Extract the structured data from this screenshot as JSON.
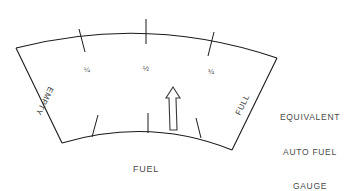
{
  "diagram": {
    "title": "Equivalent Auto Fuel Gauge",
    "background_color": "#ffffff",
    "line_color": "#1a1a1a",
    "text_color": "#4a4a4a"
  },
  "gauge": {
    "type": "arc-sector-fuel-gauge",
    "scale_labels": [
      {
        "id": "quarter",
        "text": "¼",
        "x": 87,
        "y": 70
      },
      {
        "id": "half",
        "text": "½",
        "x": 146,
        "y": 69
      },
      {
        "id": "three-quarter",
        "text": "¾",
        "x": 211,
        "y": 72
      }
    ],
    "edge_labels": [
      {
        "id": "empty",
        "text": "EMPTY",
        "x": 44,
        "y": 101,
        "rotation": -244
      },
      {
        "id": "full",
        "text": "FULL",
        "x": 243,
        "y": 105,
        "rotation": -64
      }
    ],
    "needle": {
      "label": "fuel-level-needle",
      "points": "173,87 180,98 176,98 177,130 170,130 169,98 166,98",
      "indicated_level": "just above ½"
    },
    "outer_arc": "M 16,48 Q 148,14 277,58",
    "inner_arc": "M 62,143 Q 150,117 232,150",
    "left_edge": "M 16,48 L 62,143",
    "right_edge": "M 277,58 L 232,150",
    "outer_ticks": [
      "M 79,29 L 85,52",
      "M 146,19 L 146,44",
      "M 214,32 L 208,56"
    ],
    "inner_ticks": [
      "M 98,115 L 92,137",
      "M 148,113 L 148,133",
      "M 196,118 L 201,138"
    ]
  },
  "captions": {
    "fuel": "FUEL",
    "equivalent_line1": "EQUIVALENT",
    "equivalent_line2": "AUTO FUEL",
    "equivalent_line3": "GAUGE"
  }
}
